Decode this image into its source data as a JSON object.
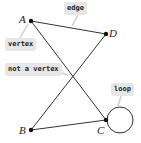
{
  "vertices": [
    {
      "id": "A",
      "label": "A",
      "x": 31,
      "y": 21
    },
    {
      "id": "D",
      "label": "D",
      "x": 106,
      "y": 34
    },
    {
      "id": "B",
      "label": "B",
      "x": 31,
      "y": 130
    },
    {
      "id": "C",
      "label": "C",
      "x": 106,
      "y": 120
    }
  ],
  "edges": [
    [
      "A",
      "D"
    ],
    [
      "A",
      "C"
    ],
    [
      "D",
      "B"
    ],
    [
      "B",
      "C"
    ]
  ],
  "loop": {
    "at": "C",
    "cx": 120,
    "cy": 120,
    "r": 13
  },
  "annotations": {
    "edge": "edge",
    "vertex": "vertex",
    "not_a_vertex": "not a vertex",
    "loop": "loop"
  },
  "colors": {
    "line": "#333333",
    "tag_bg": "#e6e6e6"
  }
}
